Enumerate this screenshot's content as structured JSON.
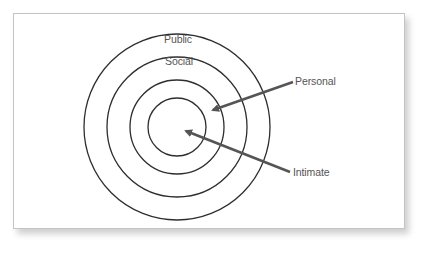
{
  "diagram": {
    "zones": [
      {
        "name": "Public",
        "label": "Public",
        "radius": 93
      },
      {
        "name": "Social",
        "label": "Social",
        "radius": 70
      },
      {
        "name": "Personal",
        "label": "Personal",
        "radius": 47
      },
      {
        "name": "Intimate",
        "label": "Intimate",
        "radius": 29
      }
    ],
    "center": {
      "x": 177,
      "y": 127
    },
    "callouts": [
      {
        "label": "Personal",
        "from": {
          "x": 293,
          "y": 82
        },
        "to": {
          "x": 212,
          "y": 110
        }
      },
      {
        "label": "Intimate",
        "from": {
          "x": 290,
          "y": 172
        },
        "to": {
          "x": 185,
          "y": 131
        }
      }
    ],
    "colors": {
      "circle_stroke": "#2e2e2e",
      "arrow": "#555555",
      "text": "#555555",
      "frame_border": "#c4c4c4"
    }
  }
}
